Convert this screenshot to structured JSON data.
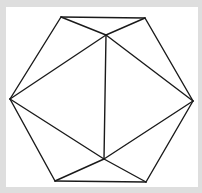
{
  "diagram": {
    "type": "geometry-figure",
    "colors": {
      "background": "#dedede",
      "panel": "#ffffff",
      "stroke": "#1a1a1a"
    },
    "vertices": {
      "top_left": [
        61,
        17
      ],
      "top_right": [
        145,
        18
      ],
      "inner_top": [
        106,
        35
      ],
      "left": [
        10,
        99
      ],
      "right": [
        193,
        101
      ],
      "inner_bottom": [
        104,
        159
      ],
      "bottom_left": [
        55,
        181
      ],
      "bottom_right": [
        146,
        182
      ]
    },
    "edges": [
      [
        "top_left",
        "top_right"
      ],
      [
        "top_left",
        "left"
      ],
      [
        "top_right",
        "right"
      ],
      [
        "left",
        "bottom_left"
      ],
      [
        "right",
        "bottom_right"
      ],
      [
        "bottom_left",
        "bottom_right"
      ],
      [
        "top_left",
        "inner_top"
      ],
      [
        "top_right",
        "inner_top"
      ],
      [
        "left",
        "inner_top"
      ],
      [
        "right",
        "inner_top"
      ],
      [
        "inner_top",
        "inner_bottom"
      ],
      [
        "left",
        "inner_bottom"
      ],
      [
        "right",
        "inner_bottom"
      ],
      [
        "bottom_left",
        "inner_bottom"
      ],
      [
        "bottom_right",
        "inner_bottom"
      ]
    ]
  }
}
